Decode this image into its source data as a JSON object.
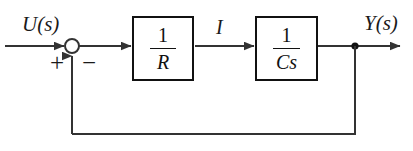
{
  "diagram": {
    "background_color": "#ffffff",
    "line_color": "#333333",
    "block_border_color": "#111111",
    "text_color": "#1a1a1a",
    "width": 413,
    "height": 151
  },
  "signals": {
    "input_label": "U(s)",
    "intermediate_label": "I",
    "output_label": "Y(s)"
  },
  "summing_junction": {
    "name": "summing-junction",
    "input_sign": "+",
    "feedback_sign": "−",
    "center_x": 72,
    "center_y": 46,
    "radius": 7
  },
  "blocks": [
    {
      "name": "resistor-block",
      "numerator": "1",
      "denominator": "R",
      "transfer_function": "1/R"
    },
    {
      "name": "capacitor-block",
      "numerator": "1",
      "denominator": "Cs",
      "transfer_function": "1/Cs"
    }
  ],
  "nodes": {
    "output_branch_label": "branch node",
    "branch_x": 355,
    "branch_y": 46
  },
  "paths": {
    "forward_y": 46,
    "feedback_y": 134,
    "feedback_left_x": 72,
    "input_start_x": 5,
    "output_end_x": 400
  }
}
